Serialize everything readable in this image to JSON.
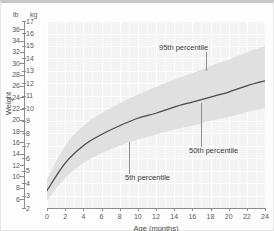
{
  "chart_data": {
    "type": "line",
    "title": "",
    "xlabel": "Age (months)",
    "ylabel": "Weight",
    "xlim": [
      0,
      24
    ],
    "ylim_kg": [
      2,
      17
    ],
    "ylim_lb": [
      4.4,
      37.5
    ],
    "grid": true,
    "legend": "none",
    "x_ticks": [
      0,
      2,
      4,
      6,
      8,
      10,
      12,
      14,
      16,
      18,
      20,
      22,
      24
    ],
    "y_ticks_kg": [
      2,
      3,
      4,
      5,
      6,
      7,
      8,
      9,
      10,
      11,
      12,
      13,
      14,
      15,
      16,
      17
    ],
    "y_ticks_lb": [
      6,
      8,
      10,
      12,
      14,
      16,
      18,
      20,
      22,
      24,
      26,
      28,
      30,
      32,
      34,
      36
    ],
    "unit_header_left": "lb",
    "unit_header_right": "kg",
    "x": [
      0,
      2,
      4,
      6,
      8,
      10,
      12,
      14,
      16,
      18,
      20,
      22,
      24
    ],
    "series": [
      {
        "name": "50th percentile",
        "units": "kg",
        "values": [
          3.4,
          5.6,
          7.0,
          7.9,
          8.6,
          9.2,
          9.6,
          10.1,
          10.5,
          10.9,
          11.3,
          11.8,
          12.2
        ]
      },
      {
        "name": "5th percentile",
        "units": "kg",
        "values": [
          2.6,
          4.4,
          5.6,
          6.4,
          7.0,
          7.5,
          7.9,
          8.3,
          8.6,
          9.0,
          9.3,
          9.7,
          10.0
        ]
      },
      {
        "name": "95th percentile",
        "units": "kg",
        "values": [
          4.3,
          7.0,
          8.6,
          9.6,
          10.4,
          11.1,
          11.7,
          12.3,
          12.8,
          13.4,
          13.9,
          14.5,
          15.0
        ]
      }
    ],
    "annotations": [
      {
        "text": "95th percentile",
        "target_x": 17.5,
        "target_y_kg": 13.0
      },
      {
        "text": "50th percentile",
        "target_x": 17.0,
        "target_y_kg": 10.4
      },
      {
        "text": "5th percentile",
        "target_x": 9.0,
        "target_y_kg": 7.3
      }
    ],
    "colors": {
      "median_line": "#4a4a4a",
      "band_fill": "#dcdcdc",
      "plot_background": "#f4f4f4",
      "gridline": "#ffffff",
      "axis": "#8c8c8c",
      "tick_text": "#5a5a5a",
      "annotation_text": "#3c3c3c",
      "leader_line": "#8f8f8f"
    }
  }
}
